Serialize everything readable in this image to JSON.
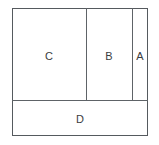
{
  "diagram": {
    "type": "partitioned-rectangle",
    "outer": {
      "x": 12,
      "y": 8,
      "width": 136,
      "height": 128,
      "border_color": "#555a5e",
      "fill_color": "#ffffff"
    },
    "divider_color": "#5e6367",
    "label_color": "#3a3d40",
    "regions": [
      {
        "id": "cell-c",
        "label": "C",
        "x": 12,
        "y": 8,
        "width": 74,
        "height": 92
      },
      {
        "id": "cell-b",
        "label": "B",
        "x": 86,
        "y": 8,
        "width": 46,
        "height": 92
      },
      {
        "id": "cell-a",
        "label": "A",
        "x": 132,
        "y": 8,
        "width": 16,
        "height": 92
      },
      {
        "id": "cell-d",
        "label": "D",
        "x": 12,
        "y": 100,
        "width": 136,
        "height": 36
      }
    ],
    "dividers": [
      {
        "id": "divider-c-b",
        "orientation": "vertical",
        "position": 86
      },
      {
        "id": "divider-b-a",
        "orientation": "vertical",
        "position": 132
      },
      {
        "id": "divider-top-bottom",
        "orientation": "horizontal",
        "position": 100
      }
    ]
  }
}
